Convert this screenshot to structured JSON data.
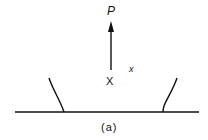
{
  "diagram": {
    "force_label": "P",
    "point_label": "X",
    "coord_label": "x",
    "caption": "(a)",
    "colors": {
      "stroke": "#111111",
      "background": "#ffffff"
    }
  }
}
